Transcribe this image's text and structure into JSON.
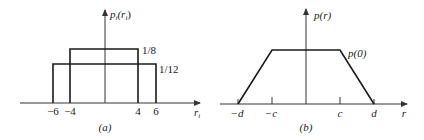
{
  "panels": [
    {
      "id": "a",
      "caption": "(a)",
      "y_axis_label": "p",
      "y_axis_sub": "i",
      "y_axis_arg_open": "(r",
      "y_axis_arg_sub": "i",
      "y_axis_arg_close": ")",
      "x_axis_label": "r",
      "x_axis_sub": "i",
      "ticks": [
        "−6",
        "−4",
        "4",
        "6"
      ],
      "levels": [
        "1/8",
        "1/12"
      ],
      "description": "Two uniform densities: height 1/8 on [-4,4] and height 1/12 on [-6,6]"
    },
    {
      "id": "b",
      "caption": "(b)",
      "y_axis_label": "p(r)",
      "x_axis_label": "r",
      "ticks": [
        "−d",
        "−c",
        "c",
        "d"
      ],
      "level_label": "p(0)",
      "description": "Trapezoidal density: rises linearly from -d to -c, flat at p(0) between -c and c, falls linearly to d"
    }
  ]
}
